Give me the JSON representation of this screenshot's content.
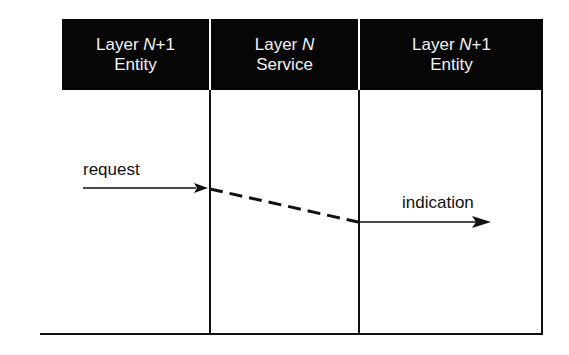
{
  "columns": [
    {
      "prefix": "Layer ",
      "layer_var": "N",
      "suffix": "+1",
      "role": "Entity"
    },
    {
      "prefix": "Layer ",
      "layer_var": "N",
      "suffix": "",
      "role": "Service"
    },
    {
      "prefix": "Layer ",
      "layer_var": "N",
      "suffix": "+1",
      "role": "Entity"
    }
  ],
  "arrows": {
    "request": {
      "label": "request"
    },
    "indication": {
      "label": "indication"
    }
  },
  "colors": {
    "header_bg": "#060606",
    "header_text": "#f2f2f2",
    "line": "#111111"
  }
}
